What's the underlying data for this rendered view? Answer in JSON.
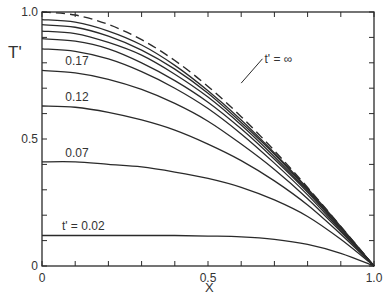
{
  "chart_data": {
    "type": "line",
    "title": "",
    "xlabel": "X",
    "ylabel": "T'",
    "xlim": [
      0,
      1.0
    ],
    "ylim": [
      0,
      1.0
    ],
    "x_ticks": [
      {
        "value": 0,
        "label": "0"
      },
      {
        "value": 0.5,
        "label": "0.5"
      },
      {
        "value": 1.0,
        "label": "1.0"
      }
    ],
    "x_minor_ticks": [
      0.1,
      0.2,
      0.3,
      0.4,
      0.6,
      0.7,
      0.8,
      0.9
    ],
    "y_ticks": [
      {
        "value": 0,
        "label": "0"
      },
      {
        "value": 0.5,
        "label": "0.5"
      },
      {
        "value": 1.0,
        "label": "1.0"
      }
    ],
    "y_minor_ticks": [
      0.1,
      0.2,
      0.3,
      0.4,
      0.6,
      0.7,
      0.8,
      0.9
    ],
    "grid": false,
    "legend": "none (inline curve labels)",
    "x": [
      0,
      0.1,
      0.2,
      0.3,
      0.4,
      0.5,
      0.6,
      0.7,
      0.8,
      0.9,
      1.0
    ],
    "series": [
      {
        "name": "t' = ∞",
        "style": "dashed",
        "label": "t' = ∞",
        "values": [
          1.0,
          0.988,
          0.951,
          0.891,
          0.809,
          0.707,
          0.588,
          0.454,
          0.309,
          0.156,
          0
        ]
      },
      {
        "name": "curve-a",
        "style": "solid",
        "label": "",
        "values": [
          0.97,
          0.96,
          0.925,
          0.87,
          0.79,
          0.69,
          0.575,
          0.445,
          0.305,
          0.155,
          0
        ]
      },
      {
        "name": "curve-b",
        "style": "solid",
        "label": "",
        "values": [
          0.95,
          0.94,
          0.905,
          0.85,
          0.775,
          0.68,
          0.565,
          0.44,
          0.3,
          0.15,
          0
        ]
      },
      {
        "name": "curve-c",
        "style": "solid",
        "label": "",
        "values": [
          0.925,
          0.915,
          0.88,
          0.83,
          0.755,
          0.665,
          0.555,
          0.43,
          0.295,
          0.15,
          0
        ]
      },
      {
        "name": "curve-d",
        "style": "solid",
        "label": "",
        "values": [
          0.895,
          0.885,
          0.855,
          0.8,
          0.73,
          0.645,
          0.54,
          0.42,
          0.29,
          0.145,
          0
        ]
      },
      {
        "name": "curve-e",
        "style": "solid",
        "label": "",
        "values": [
          0.855,
          0.845,
          0.815,
          0.765,
          0.7,
          0.62,
          0.52,
          0.405,
          0.28,
          0.14,
          0
        ]
      },
      {
        "name": "t' = 0.17",
        "style": "solid",
        "label": "0.17",
        "values": [
          0.77,
          0.76,
          0.735,
          0.695,
          0.64,
          0.57,
          0.48,
          0.38,
          0.265,
          0.135,
          0
        ]
      },
      {
        "name": "t' = 0.12",
        "style": "solid",
        "label": "0.12",
        "values": [
          0.63,
          0.625,
          0.605,
          0.575,
          0.535,
          0.48,
          0.415,
          0.335,
          0.24,
          0.125,
          0
        ]
      },
      {
        "name": "t' = 0.07",
        "style": "solid",
        "label": "0.07",
        "values": [
          0.41,
          0.41,
          0.4,
          0.39,
          0.37,
          0.345,
          0.31,
          0.26,
          0.195,
          0.105,
          0
        ]
      },
      {
        "name": "t' = 0.02",
        "style": "solid",
        "label": "t' = 0.02",
        "values": [
          0.12,
          0.12,
          0.12,
          0.12,
          0.12,
          0.118,
          0.115,
          0.105,
          0.085,
          0.05,
          0
        ]
      }
    ],
    "annotations": [
      {
        "text": "t' = ∞",
        "x": 0.67,
        "y": 0.8,
        "leader_to": {
          "x": 0.6,
          "y": 0.72
        }
      },
      {
        "text": "0.17",
        "x": 0.07,
        "y": 0.79
      },
      {
        "text": "0.12",
        "x": 0.07,
        "y": 0.65
      },
      {
        "text": "0.07",
        "x": 0.07,
        "y": 0.43
      },
      {
        "text": "t' = 0.02",
        "x": 0.06,
        "y": 0.14
      }
    ]
  },
  "axes": {
    "origin_label": "0",
    "ylabel_text": "T'",
    "xlabel_text": "X"
  },
  "colors": {
    "line": "#2a2a2a",
    "text": "#333333",
    "background": "#ffffff"
  }
}
